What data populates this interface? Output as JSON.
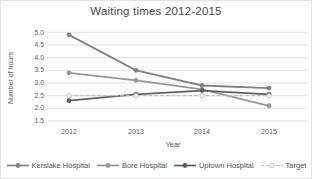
{
  "chart_data": {
    "type": "line",
    "title": "Waiting times 2012-2015",
    "xlabel": "Year",
    "ylabel": "Number of hours",
    "categories": [
      "2012",
      "2013",
      "2014",
      "2015"
    ],
    "ylim": [
      1.5,
      5.0
    ],
    "ytick_step": 0.5,
    "grid": true,
    "legend_position": "bottom",
    "series": [
      {
        "name": "Kerslake Hospital",
        "values": [
          4.9,
          3.5,
          2.9,
          2.8
        ],
        "color": "#828282",
        "dash": "none",
        "marker": "filled"
      },
      {
        "name": "Bore Hospital",
        "values": [
          3.4,
          3.1,
          2.75,
          2.1
        ],
        "color": "#979797",
        "dash": "none",
        "marker": "filled"
      },
      {
        "name": "Uptown Hospital",
        "values": [
          2.3,
          2.55,
          2.7,
          2.55
        ],
        "color": "#5f5f5f",
        "dash": "none",
        "marker": "filled"
      },
      {
        "name": "Target",
        "values": [
          2.5,
          2.5,
          2.5,
          2.5
        ],
        "color": "#bdbdbd",
        "dash": "dashed",
        "marker": "open"
      }
    ]
  },
  "colors": {
    "title_text": "#474747",
    "axis_text": "#595959",
    "gridline": "#dcdcdc",
    "background": "#fefefe",
    "open_marker_fill": "#ffffff"
  }
}
